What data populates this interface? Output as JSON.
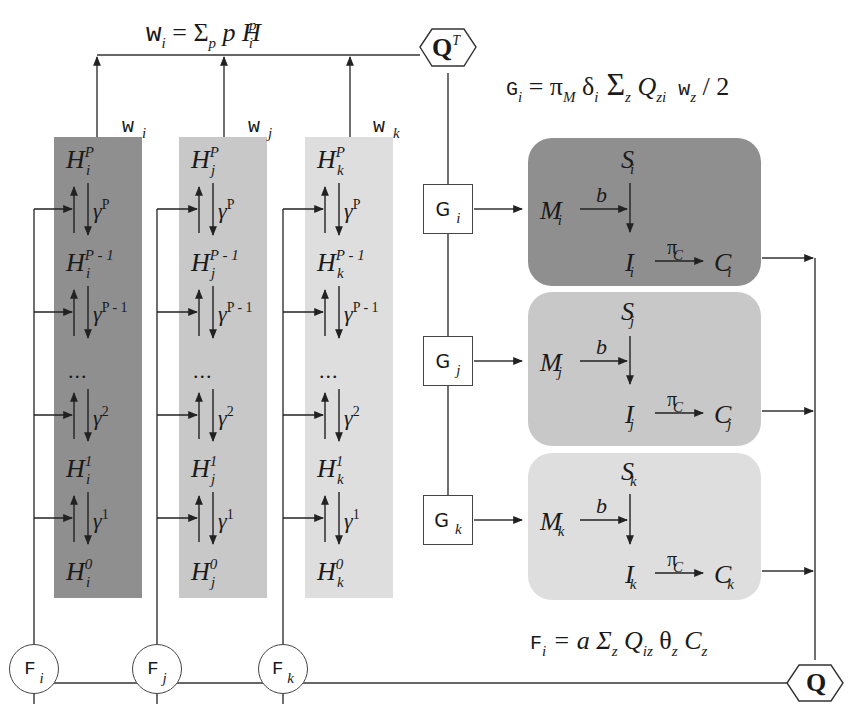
{
  "diagram": {
    "title_equation_w": {
      "lhs": "w",
      "lhs_sub": "i",
      "rhs": "= Σ",
      "sum_sub": "p",
      "term": "p H",
      "term_sub": "i",
      "term_sup": "p"
    },
    "equation_g": {
      "lhs": "G",
      "lhs_sub": "i",
      "rhs": "= π",
      "pi_sub": "M",
      "delta": " δ",
      "delta_sub": "i",
      "sum": " Σ",
      "sum_sub": "z",
      "q": " Q",
      "q_sub": "zi",
      "w": " w",
      "w_sub": "z",
      "tail": " / 2"
    },
    "equation_f": {
      "lhs": "F",
      "lhs_sub": "i",
      "rhs": "= a Σ",
      "sum_sub": "z",
      "q": " Q",
      "q_sub": "iz",
      "theta": " θ",
      "theta_sub": "z",
      "c": " C",
      "c_sub": "z"
    },
    "hex_top": {
      "label": "Q",
      "sup": "T"
    },
    "hex_bottom": {
      "label": "Q"
    },
    "columns": [
      {
        "id": "i",
        "color": "#8f8f8f",
        "w_label": "w",
        "w_sub": "i",
        "levels": [
          {
            "h": "H",
            "sub": "i",
            "sup": "P"
          },
          {
            "h": "H",
            "sub": "i",
            "sup": "P - 1"
          },
          {
            "h": "H",
            "sub": "i",
            "sup": "1"
          },
          {
            "h": "H",
            "sub": "i",
            "sup": "0"
          }
        ],
        "gammas": [
          {
            "g": "γ",
            "sup": "P"
          },
          {
            "g": "γ",
            "sup": "P - 1"
          },
          {
            "g": "γ",
            "sup": "2"
          },
          {
            "g": "γ",
            "sup": "1"
          }
        ],
        "ellipsis": "...",
        "f_label": "F",
        "f_sub": "i"
      },
      {
        "id": "j",
        "color": "#c8c8c8",
        "w_label": "w",
        "w_sub": "j",
        "levels": [
          {
            "h": "H",
            "sub": "j",
            "sup": "P"
          },
          {
            "h": "H",
            "sub": "j",
            "sup": "P - 1"
          },
          {
            "h": "H",
            "sub": "j",
            "sup": "1"
          },
          {
            "h": "H",
            "sub": "j",
            "sup": "0"
          }
        ],
        "gammas": [
          {
            "g": "γ",
            "sup": "P"
          },
          {
            "g": "γ",
            "sup": "P - 1"
          },
          {
            "g": "γ",
            "sup": "2"
          },
          {
            "g": "γ",
            "sup": "1"
          }
        ],
        "ellipsis": "...",
        "f_label": "F",
        "f_sub": "j"
      },
      {
        "id": "k",
        "color": "#dedede",
        "w_label": "w",
        "w_sub": "k",
        "levels": [
          {
            "h": "H",
            "sub": "k",
            "sup": "P"
          },
          {
            "h": "H",
            "sub": "k",
            "sup": "P - 1"
          },
          {
            "h": "H",
            "sub": "k",
            "sup": "1"
          },
          {
            "h": "H",
            "sub": "k",
            "sup": "0"
          }
        ],
        "gammas": [
          {
            "g": "γ",
            "sup": "P"
          },
          {
            "g": "γ",
            "sup": "P - 1"
          },
          {
            "g": "γ",
            "sup": "2"
          },
          {
            "g": "γ",
            "sup": "1"
          }
        ],
        "ellipsis": "...",
        "f_label": "F",
        "f_sub": "k"
      }
    ],
    "blocks": [
      {
        "id": "i",
        "color": "#8f8f8f",
        "g_label": "G",
        "g_sub": "i",
        "S": "S",
        "M": "M",
        "I": "I",
        "C": "C",
        "sub": "i",
        "b": "b",
        "pi": "π",
        "pi_sub": "C"
      },
      {
        "id": "j",
        "color": "#c8c8c8",
        "g_label": "G",
        "g_sub": "j",
        "S": "S",
        "M": "M",
        "I": "I",
        "C": "C",
        "sub": "j",
        "b": "b",
        "pi": "π",
        "pi_sub": "C"
      },
      {
        "id": "k",
        "color": "#dedede",
        "g_label": "G",
        "g_sub": "k",
        "S": "S",
        "M": "M",
        "I": "I",
        "C": "C",
        "sub": "k",
        "b": "b",
        "pi": "π",
        "pi_sub": "C"
      }
    ]
  }
}
